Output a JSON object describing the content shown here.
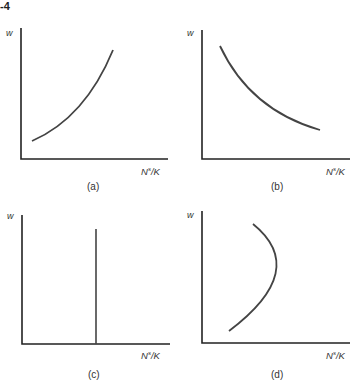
{
  "figure": {
    "number_fragment": "-4",
    "line_color": "#3a3a3a",
    "panels": [
      {
        "id": "a",
        "caption": "(a)",
        "y_label": "w",
        "x_label_base": "N",
        "x_label_sup": "s",
        "x_label_tail": "/K",
        "curve": "upward-sloping, convex"
      },
      {
        "id": "b",
        "caption": "(b)",
        "y_label": "w",
        "x_label_base": "N",
        "x_label_sup": "s",
        "x_label_tail": "/K",
        "curve": "downward-sloping, convex"
      },
      {
        "id": "c",
        "caption": "(c)",
        "y_label": "w",
        "x_label_base": "N",
        "x_label_sup": "s",
        "x_label_tail": "/K",
        "curve": "vertical line"
      },
      {
        "id": "d",
        "caption": "(d)",
        "y_label": "w",
        "x_label_base": "N",
        "x_label_sup": "s",
        "x_label_tail": "/K",
        "curve": "backward-bending"
      }
    ]
  }
}
